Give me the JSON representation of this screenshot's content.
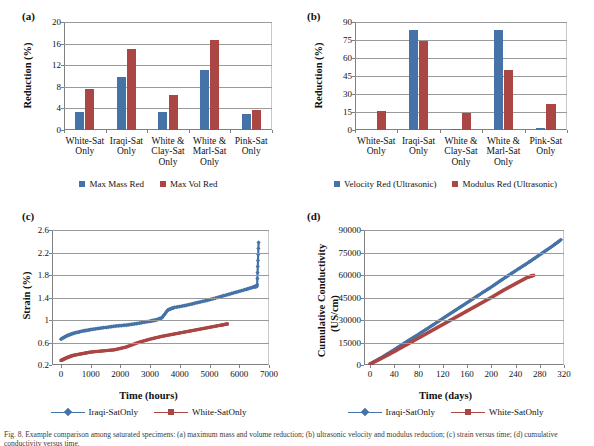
{
  "figure": {
    "caption": "Fig. 8. Example comparison among saturated specimens: (a) maximum mass and volume reduction; (b) ultrasonic velocity and modulus reduction; (c) strain versus time; (d) cumulative conductivity versus time."
  },
  "panels": {
    "a": {
      "tag": "(a)",
      "legend": [
        {
          "label": "Max Mass Red",
          "color": "#4573a7"
        },
        {
          "label": "Max Vol Red",
          "color": "#aa4643"
        }
      ]
    },
    "b": {
      "tag": "(b)",
      "legend": [
        {
          "label": "Velocity Red (Ultrasonic)",
          "color": "#4573a7"
        },
        {
          "label": "Modulus Red (Ultrasonic)",
          "color": "#aa4643"
        }
      ]
    },
    "c": {
      "tag": "(c)",
      "legend": [
        {
          "label": "Iraqi-SatOnly",
          "color": "#4573a7"
        },
        {
          "label": "White-SatOnly",
          "color": "#aa4643"
        }
      ]
    },
    "d": {
      "tag": "(d)",
      "legend": [
        {
          "label": "Iraqi-SatOnly",
          "color": "#4573a7"
        },
        {
          "label": "White-SatOnly",
          "color": "#aa4643"
        }
      ]
    }
  },
  "chart_data": [
    {
      "id": "a",
      "type": "bar",
      "title": "",
      "xlabel": "",
      "ylabel": "Reduction (%)",
      "ylim": [
        0,
        20
      ],
      "yticks": [
        0,
        4,
        8,
        12,
        16,
        20
      ],
      "grid": true,
      "legend_position": "bottom",
      "categories": [
        "White-Sat Only",
        "Iraqi-Sat Only",
        "White & Clay-Sat Only",
        "White & Marl-Sat Only",
        "Pink-Sat Only"
      ],
      "categories_lines": [
        [
          "White-Sat",
          "Only"
        ],
        [
          "Iraqi-Sat",
          "Only"
        ],
        [
          "White &",
          "Clay-Sat",
          "Only"
        ],
        [
          "White &",
          "Marl-Sat",
          "Only"
        ],
        [
          "Pink-Sat",
          "Only"
        ]
      ],
      "series": [
        {
          "name": "Max Mass Red",
          "color": "#4573a7",
          "values": [
            3.4,
            9.8,
            3.3,
            11.2,
            2.9
          ]
        },
        {
          "name": "Max Vol Red",
          "color": "#aa4643",
          "values": [
            7.6,
            15.0,
            6.4,
            16.6,
            3.7
          ]
        }
      ]
    },
    {
      "id": "b",
      "type": "bar",
      "title": "",
      "xlabel": "",
      "ylabel": "Reduction (%)",
      "ylim": [
        0,
        90
      ],
      "yticks": [
        0,
        15,
        30,
        45,
        60,
        75,
        90
      ],
      "grid": true,
      "legend_position": "bottom",
      "categories": [
        "White-Sat Only",
        "Iraqi-Sat Only",
        "White & Clay-Sat Only",
        "White & Marl-Sat Only",
        "Pink-Sat Only"
      ],
      "categories_lines": [
        [
          "White-Sat",
          "Only"
        ],
        [
          "Iraqi-Sat",
          "Only"
        ],
        [
          "White &",
          "Clay-Sat",
          "Only"
        ],
        [
          "White &",
          "Marl-Sat",
          "Only"
        ],
        [
          "Pink-Sat",
          "Only"
        ]
      ],
      "series": [
        {
          "name": "Velocity Red (Ultrasonic)",
          "color": "#4573a7",
          "values": [
            0,
            83,
            0.7,
            83,
            1.8
          ]
        },
        {
          "name": "Modulus Red (Ultrasonic)",
          "color": "#aa4643",
          "values": [
            15.8,
            74.5,
            14.5,
            50,
            21.5
          ]
        }
      ]
    },
    {
      "id": "c",
      "type": "line",
      "title": "",
      "xlabel": "Time (hours)",
      "ylabel": "Strain (%)",
      "xlim": [
        -300,
        7000
      ],
      "ylim": [
        0.2,
        2.6
      ],
      "xticks": [
        0,
        1000,
        2000,
        3000,
        4000,
        5000,
        6000,
        7000
      ],
      "yticks": [
        0.2,
        0.6,
        1.0,
        1.4,
        1.8,
        2.2,
        2.6
      ],
      "ytick_labels": [
        "0.2",
        "0.6",
        "1",
        "1.4",
        "1.8",
        "2.2",
        "2.6"
      ],
      "grid": true,
      "legend_position": "bottom",
      "series": [
        {
          "name": "Iraqi-SatOnly",
          "color": "#4573a7",
          "marker": "diamond",
          "x": [
            0,
            200,
            400,
            700,
            1000,
            1400,
            1800,
            2200,
            2600,
            3000,
            3200,
            3400,
            3600,
            3800,
            4200,
            4600,
            5000,
            5400,
            5800,
            6200,
            6500,
            6600,
            6650
          ],
          "y": [
            0.66,
            0.72,
            0.76,
            0.8,
            0.83,
            0.86,
            0.89,
            0.91,
            0.94,
            0.98,
            1.0,
            1.04,
            1.18,
            1.22,
            1.26,
            1.31,
            1.36,
            1.42,
            1.48,
            1.54,
            1.59,
            1.6,
            2.38
          ]
        },
        {
          "name": "White-SatOnly",
          "color": "#aa4643",
          "marker": "square",
          "x": [
            0,
            200,
            400,
            700,
            1000,
            1400,
            1800,
            2200,
            2600,
            3000,
            3400,
            3800,
            4200,
            4600,
            5000,
            5400,
            5600
          ],
          "y": [
            0.28,
            0.33,
            0.37,
            0.4,
            0.43,
            0.45,
            0.47,
            0.52,
            0.6,
            0.66,
            0.71,
            0.75,
            0.79,
            0.83,
            0.87,
            0.91,
            0.93
          ]
        }
      ]
    },
    {
      "id": "d",
      "type": "line",
      "title": "",
      "xlabel": "Time (days)",
      "ylabel": "Cumulative Conductivity (US/cm)",
      "ylabel_lines": [
        "Cumulative Conductivity",
        "(US/cm)"
      ],
      "xlim": [
        -10,
        320
      ],
      "ylim": [
        0,
        90000
      ],
      "xticks": [
        0,
        40,
        80,
        120,
        160,
        200,
        240,
        280,
        320
      ],
      "yticks": [
        0,
        15000,
        30000,
        45000,
        60000,
        75000,
        90000
      ],
      "grid": true,
      "legend_position": "bottom",
      "series": [
        {
          "name": "Iraqi-SatOnly",
          "color": "#4573a7",
          "marker": "diamond",
          "x": [
            0,
            20,
            40,
            60,
            80,
            100,
            120,
            140,
            160,
            180,
            200,
            220,
            240,
            260,
            280,
            300,
            315
          ],
          "y": [
            700,
            5200,
            10200,
            15500,
            20500,
            25700,
            31000,
            36300,
            41500,
            46800,
            52000,
            57500,
            62800,
            68000,
            73500,
            79000,
            83500
          ]
        },
        {
          "name": "White-SatOnly",
          "color": "#aa4643",
          "marker": "square",
          "x": [
            0,
            20,
            40,
            60,
            80,
            100,
            120,
            140,
            160,
            180,
            200,
            220,
            240,
            260,
            270
          ],
          "y": [
            600,
            4700,
            9000,
            13500,
            18000,
            22500,
            27000,
            31500,
            36000,
            40500,
            45000,
            49800,
            54200,
            58500,
            59800
          ]
        }
      ]
    }
  ]
}
